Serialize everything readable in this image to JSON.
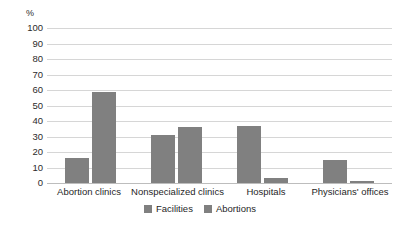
{
  "chart_data": {
    "type": "bar",
    "title": "",
    "xlabel": "",
    "ylabel": "%",
    "ylim": [
      0,
      100
    ],
    "ytick_step": 10,
    "yticks": [
      "100",
      "90",
      "80",
      "70",
      "60",
      "50",
      "40",
      "30",
      "20",
      "10",
      "0"
    ],
    "grid": true,
    "legend_position": "bottom-center",
    "categories": [
      "Abortion clinics",
      "Nonspecialized clinics",
      "Hospitals",
      "Physicians' offices"
    ],
    "series": [
      {
        "name": "Facilities",
        "color": "#808080",
        "values": [
          16,
          31,
          37,
          15
        ]
      },
      {
        "name": "Abortions",
        "color": "#808080",
        "values": [
          59,
          36,
          3,
          1
        ]
      }
    ]
  },
  "colors": {
    "bar": "#808080",
    "gridline": "#d6d6d6",
    "baseline": "#bdbdbd",
    "text": "#1f1f1f",
    "background": "#ffffff"
  }
}
